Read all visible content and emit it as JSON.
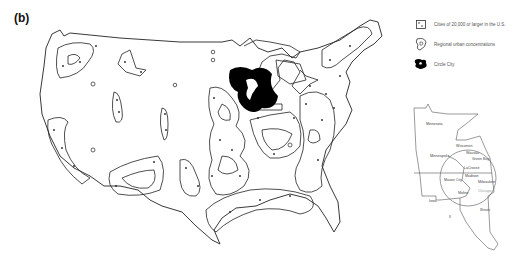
{
  "panel": {
    "label": "(b)"
  },
  "legend": {
    "items": [
      {
        "symbol": "city-dot-square",
        "label": "Cities of 20,000 or larger in the U.S."
      },
      {
        "symbol": "regional-urban-outline",
        "label": "Regional urban concentrations"
      },
      {
        "symbol": "circle-city-blob",
        "label": "Circle City"
      }
    ]
  },
  "main_map": {
    "subject": "Contiguous United States",
    "features": [
      "regional urban concentrations",
      "city dots",
      "Circle City (upper Midwest)"
    ],
    "colors": {
      "outline": "#222222",
      "circle_city_fill": "#000000",
      "background": "#ffffff"
    }
  },
  "inset_map": {
    "labels": {
      "minnesota": "Minnesota",
      "wisconsin": "Wisconsin",
      "minneapolis": "Minneapolis",
      "wausau": "Wausau",
      "green_bay": "Green Bay",
      "lacrosse": "LaCrosse",
      "madison": "Madison",
      "mason_city": "Mason City",
      "milwaukee": "Milwaukee",
      "chicago": "Chicago",
      "moline": "Moline",
      "iowa": "Iowa",
      "illinois": "Illinois",
      "il": "Il"
    }
  }
}
